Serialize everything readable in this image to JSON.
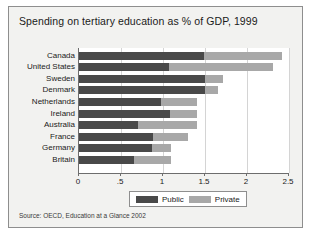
{
  "chart_data": {
    "type": "bar",
    "orientation": "horizontal",
    "stacked": true,
    "title": "Spending on tertiary education as % of GDP, 1999",
    "xlabel": "",
    "ylabel": "",
    "xlim": [
      0,
      2.5
    ],
    "xticks": [
      0,
      0.5,
      1,
      1.5,
      2,
      2.5
    ],
    "xticklabels": [
      "0",
      ".5",
      "1",
      "1.5",
      "2",
      "2.5"
    ],
    "grid": true,
    "legend_position": "bottom",
    "categories": [
      "Canada",
      "United States",
      "Sweden",
      "Denmark",
      "Netherlands",
      "Ireland",
      "Australia",
      "France",
      "Germany",
      "Britain"
    ],
    "series": [
      {
        "name": "Public",
        "color": "#494949",
        "values": [
          1.49,
          1.07,
          1.5,
          1.5,
          0.98,
          1.08,
          0.7,
          0.88,
          0.87,
          0.66
        ]
      },
      {
        "name": "Private",
        "color": "#a8a8a8",
        "values": [
          0.93,
          1.24,
          0.21,
          0.16,
          0.43,
          0.33,
          0.71,
          0.42,
          0.23,
          0.44
        ]
      }
    ],
    "totals": [
      2.42,
      2.31,
      1.71,
      1.66,
      1.41,
      1.41,
      1.41,
      1.3,
      1.1,
      1.1
    ],
    "source": "Source: OECD, Education at a Glance 2002"
  },
  "legend": {
    "items": [
      {
        "label": "Public",
        "color": "#494949"
      },
      {
        "label": "Private",
        "color": "#a8a8a8"
      }
    ]
  }
}
